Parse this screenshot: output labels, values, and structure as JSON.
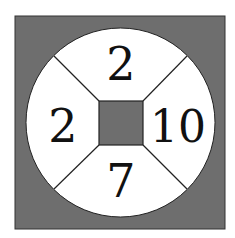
{
  "diagram": {
    "type": "number-wheel-puzzle",
    "colors": {
      "background": "#ffffff",
      "outer_square_fill": "#6e6e6e",
      "circle_fill": "#ffffff",
      "center_square_fill": "#6e6e6e",
      "lines": "#222222",
      "text": "#111111"
    },
    "segments": {
      "top": "2",
      "left": "2",
      "right": "10",
      "bottom": "7"
    }
  }
}
